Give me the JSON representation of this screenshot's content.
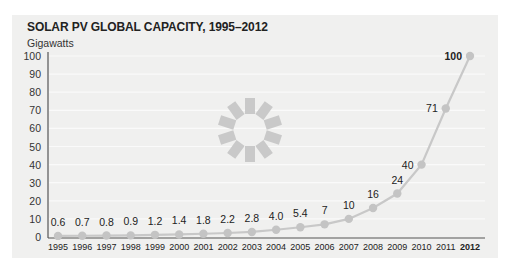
{
  "chart_data": {
    "type": "line",
    "title": "SOLAR PV GLOBAL CAPACITY, 1995–2012",
    "ylabel": "Gigawatts",
    "xlabel": "",
    "x": [
      "1995",
      "1996",
      "1997",
      "1998",
      "1999",
      "2000",
      "2001",
      "2002",
      "2003",
      "2004",
      "2005",
      "2006",
      "2007",
      "2008",
      "2009",
      "2010",
      "2011",
      "2012"
    ],
    "series": [
      {
        "name": "Solar PV global capacity (GW)",
        "values": [
          0.6,
          0.7,
          0.8,
          0.9,
          1.2,
          1.4,
          1.8,
          2.2,
          2.8,
          4.0,
          5.4,
          7,
          10,
          16,
          24,
          40,
          71,
          100
        ]
      }
    ],
    "data_labels": [
      "0.6",
      "0.7",
      "0.8",
      "0.9",
      "1.2",
      "1.4",
      "1.8",
      "2.2",
      "2.8",
      "4.0",
      "5.4",
      "7",
      "10",
      "16",
      "24",
      "40",
      "71",
      "100"
    ],
    "yticks": [
      0,
      10,
      20,
      30,
      40,
      50,
      60,
      70,
      80,
      90,
      100
    ],
    "ylim": [
      0,
      100
    ],
    "grid": true,
    "legend": "none",
    "highlighted_label": "2012",
    "decoration": "sun-icon",
    "colors": {
      "line": "#c8c8c8",
      "marker": "#c4c4c4",
      "axis": "#555555",
      "panel": "#f0f0ef",
      "sun": "#c9c9c9"
    }
  },
  "caption": "Figure 7. Global solar PV capacity..."
}
